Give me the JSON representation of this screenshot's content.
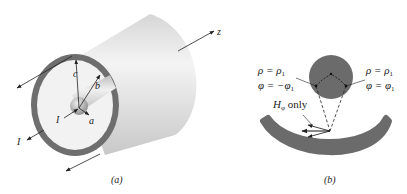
{
  "figure_a": {
    "caption": "(a)",
    "labels": {
      "c": "c",
      "b": "b",
      "a": "a",
      "I_inner": "I",
      "I_outer": "I",
      "z": "z"
    }
  },
  "figure_b": {
    "caption": "(b)",
    "left_rho": "ρ = ρ",
    "left_rho_sub": "1",
    "left_phi": "φ = −φ",
    "left_phi_sub": "1",
    "right_rho": "ρ = ρ",
    "right_rho_sub": "1",
    "right_phi": "φ = φ",
    "right_phi_sub": "1",
    "h_label": "H",
    "h_sub": "φ",
    "h_suffix": " only"
  },
  "colors": {
    "conductor": "#6b6b6b",
    "shell_light": "#e8e8e8",
    "line": "#222222"
  }
}
